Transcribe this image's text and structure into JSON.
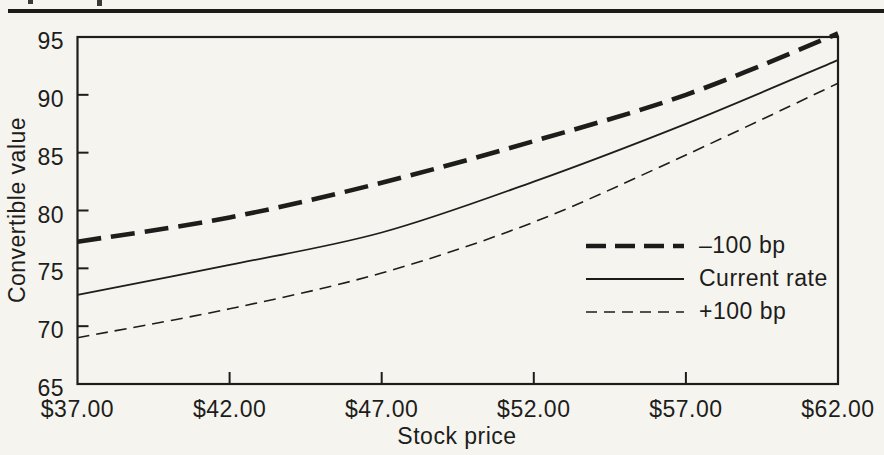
{
  "colors": {
    "ink": "#1d1d1b",
    "paper": "#f5f4ef"
  },
  "chart_data": {
    "type": "line",
    "title": "",
    "xlabel": "Stock price",
    "ylabel": "Convertible value",
    "x": [
      37,
      42,
      47,
      52,
      57,
      62
    ],
    "x_tick_labels": [
      "$37.00",
      "$42.00",
      "$47.00",
      "$52.00",
      "$57.00",
      "$62.00"
    ],
    "y_ticks": [
      65,
      70,
      75,
      80,
      85,
      90,
      95
    ],
    "xlim": [
      37,
      62
    ],
    "ylim": [
      65,
      95
    ],
    "grid": false,
    "legend_position": "inside-right",
    "series": [
      {
        "name": "–100 bp",
        "style": "thick-dashed",
        "values": [
          77.3,
          79.4,
          82.4,
          86.0,
          90.0,
          95.3
        ]
      },
      {
        "name": "Current rate",
        "style": "solid",
        "values": [
          72.7,
          75.3,
          78.1,
          82.5,
          87.5,
          93.0
        ]
      },
      {
        "name": "+100 bp",
        "style": "thin-dashed",
        "values": [
          69.0,
          71.5,
          74.6,
          79.0,
          84.8,
          91.0
        ]
      }
    ]
  }
}
